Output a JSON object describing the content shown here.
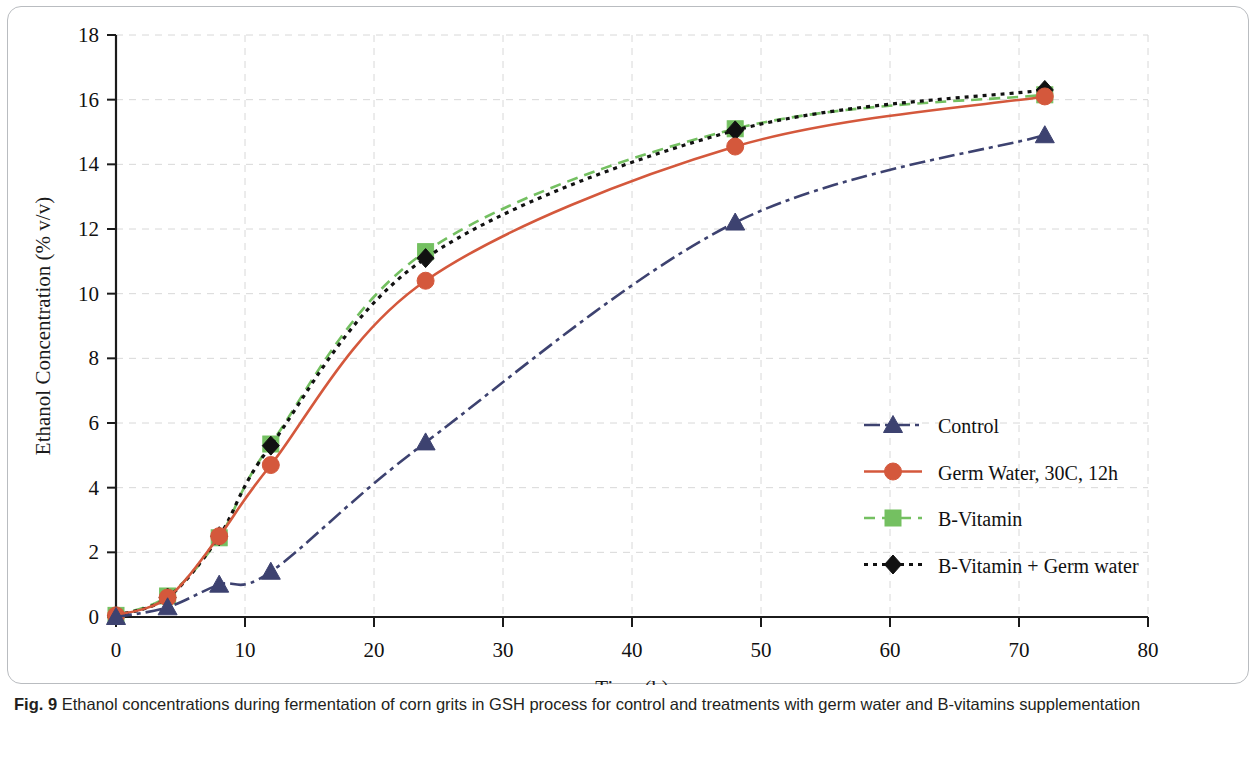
{
  "figure": {
    "caption_label": "Fig. 9",
    "caption_text": "Ethanol concentrations during fermentation of corn grits in GSH process for control and treatments with germ water and B-vitamins supplementation"
  },
  "colors": {
    "control": "#3d4270",
    "germ_water": "#d4583c",
    "b_vitamin": "#74c061",
    "b_vitamin_germ": "#111111",
    "grid": "#d8d8d8",
    "axis": "#1b1b1b",
    "frame": "#b9bcc0"
  },
  "chart_data": {
    "type": "line",
    "title": "",
    "xlabel": "Time (h)",
    "ylabel": "Ethanol Concentration (% v/v)",
    "xlim": [
      0,
      80
    ],
    "ylim": [
      0,
      18
    ],
    "xticks": [
      0,
      10,
      20,
      30,
      40,
      50,
      60,
      70,
      80
    ],
    "yticks": [
      0,
      2,
      4,
      6,
      8,
      10,
      12,
      14,
      16,
      18
    ],
    "grid": "dashed horizontal and vertical",
    "legend_position": "inside right, middle-lower",
    "x": [
      0,
      4,
      8,
      12,
      24,
      48,
      72
    ],
    "series": [
      {
        "name": "Control",
        "color": "#3d4270",
        "marker": "triangle",
        "line_style": "dash-dot",
        "values": [
          0.0,
          0.3,
          1.0,
          1.4,
          5.4,
          12.2,
          14.9
        ]
      },
      {
        "name": "Germ Water, 30C, 12h",
        "color": "#d4583c",
        "marker": "circle",
        "line_style": "solid",
        "values": [
          0.05,
          0.6,
          2.5,
          4.7,
          10.4,
          14.55,
          16.1
        ]
      },
      {
        "name": "B-Vitamin",
        "color": "#74c061",
        "marker": "square",
        "line_style": "dashed",
        "values": [
          0.05,
          0.65,
          2.45,
          5.35,
          11.3,
          15.1,
          16.15
        ]
      },
      {
        "name": "B-Vitamin + Germ water",
        "color": "#111111",
        "marker": "diamond",
        "line_style": "dotted",
        "values": [
          0.05,
          0.6,
          2.5,
          5.3,
          11.1,
          15.05,
          16.3
        ]
      }
    ]
  }
}
